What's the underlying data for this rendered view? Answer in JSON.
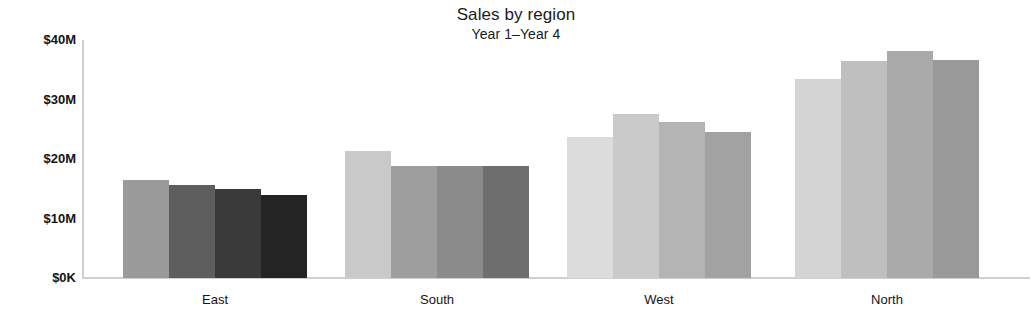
{
  "chart_data": {
    "type": "bar",
    "title": "Sales by region",
    "subtitle": "Year 1–Year 4",
    "xlabel": "",
    "ylabel": "",
    "grid": false,
    "legend": "none",
    "categories": [
      "East",
      "South",
      "West",
      "North"
    ],
    "ylim": [
      0,
      40
    ],
    "yunit": "M",
    "ytick_labels": [
      "$40M",
      "$30M",
      "$20M",
      "$10M",
      "$0K"
    ],
    "ytick_values": [
      40,
      30,
      20,
      10,
      0
    ],
    "series": [
      {
        "name": "Year 1",
        "values": [
          16.4,
          21.3,
          23.7,
          33.4
        ]
      },
      {
        "name": "Year 2",
        "values": [
          15.6,
          18.9,
          27.5,
          36.4
        ]
      },
      {
        "name": "Year 3",
        "values": [
          15.0,
          18.8,
          26.3,
          38.2
        ]
      },
      {
        "name": "Year 4",
        "values": [
          14.0,
          18.8,
          24.5,
          36.7
        ]
      }
    ],
    "bar_colors": [
      [
        "#9a9a9a",
        "#5e5e5e",
        "#3a3a3a",
        "#242424"
      ],
      [
        "#c9c9c9",
        "#9e9e9e",
        "#8b8b8b",
        "#6e6e6e"
      ],
      [
        "#dcdcdc",
        "#cacaca",
        "#b4b4b4",
        "#a2a2a2"
      ],
      [
        "#d4d4d4",
        "#bfbfbf",
        "#aaaaaa",
        "#999999"
      ]
    ],
    "axis_color": "#cfcfcf",
    "text_color": "#141414",
    "background": "#ffffff"
  },
  "layout": {
    "plot_left": 82,
    "plot_top": 40,
    "plot_width": 948,
    "plot_height": 238,
    "group_starts": [
      123,
      345,
      567,
      795
    ],
    "group_width": 184,
    "bar_width": 46
  }
}
